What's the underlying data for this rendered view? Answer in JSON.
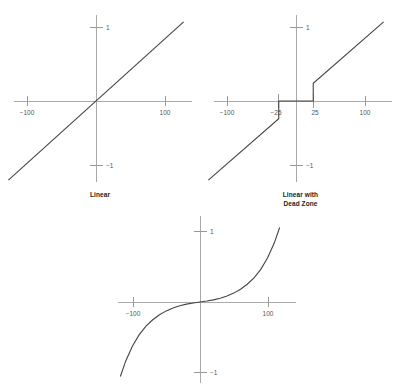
{
  "page": {
    "background_color": "#ffffff",
    "axis_color": "#aaaaaa",
    "curve_color": "#444444",
    "label_color": "#555555",
    "caption_color": "#222222"
  },
  "captions": {
    "linear": "Linear",
    "deadzone_line1": "Linear with",
    "deadzone_line2": "Dead Zone"
  },
  "chart_data": [
    {
      "id": "linear",
      "type": "line",
      "title": "Linear",
      "xlabel": "",
      "ylabel": "",
      "xlim": [
        -130,
        130
      ],
      "ylim": [
        -1.12,
        1.12
      ],
      "grid": false,
      "legend": "none",
      "xticks": [
        -100,
        100
      ],
      "xticklabels": [
        "−100",
        "100"
      ],
      "yticks": [
        -1,
        1
      ],
      "yticklabels": [
        "−1",
        "1"
      ],
      "x": [
        -127,
        127
      ],
      "y": [
        -1.07,
        1.07
      ],
      "description": "Straight proportional response through the origin"
    },
    {
      "id": "deadzone",
      "type": "line",
      "title": "Linear with Dead Zone",
      "xlabel": "",
      "ylabel": "",
      "xlim": [
        -130,
        130
      ],
      "ylim": [
        -1.12,
        1.12
      ],
      "grid": false,
      "legend": "none",
      "xticks": [
        -100,
        -25,
        25,
        100
      ],
      "xticklabels": [
        "−100",
        "−25",
        "25",
        "100"
      ],
      "yticks": [
        -1,
        1
      ],
      "yticklabels": [
        "−1",
        "1"
      ],
      "x": [
        -127,
        -25,
        -25,
        25,
        25,
        127
      ],
      "y": [
        -1.07,
        -0.24,
        0,
        0,
        0.24,
        1.07
      ],
      "deadzone": [
        -25,
        25
      ],
      "description": "Flat zero output between -25 and 25, then linear with a step"
    },
    {
      "id": "expo",
      "type": "line",
      "title": "",
      "xlabel": "",
      "ylabel": "",
      "xlim": [
        -130,
        130
      ],
      "ylim": [
        -1.12,
        1.12
      ],
      "grid": false,
      "legend": "none",
      "xticks": [
        -100,
        100
      ],
      "xticklabels": [
        "−100",
        "100"
      ],
      "yticks": [
        -1,
        1
      ],
      "yticklabels": [
        "−1",
        "1"
      ],
      "x": [
        -118,
        -110,
        -100,
        -90,
        -80,
        -70,
        -60,
        -50,
        -40,
        -30,
        -20,
        -10,
        0,
        10,
        20,
        30,
        40,
        50,
        60,
        70,
        80,
        90,
        100,
        110,
        118
      ],
      "y": [
        -1.05,
        -0.83,
        -0.62,
        -0.46,
        -0.34,
        -0.25,
        -0.18,
        -0.125,
        -0.085,
        -0.053,
        -0.03,
        -0.013,
        0,
        0.013,
        0.03,
        0.053,
        0.085,
        0.125,
        0.18,
        0.25,
        0.34,
        0.46,
        0.62,
        0.83,
        1.05
      ],
      "description": "Exponential S-curve response, gentle near center and steep at the extremes"
    }
  ]
}
